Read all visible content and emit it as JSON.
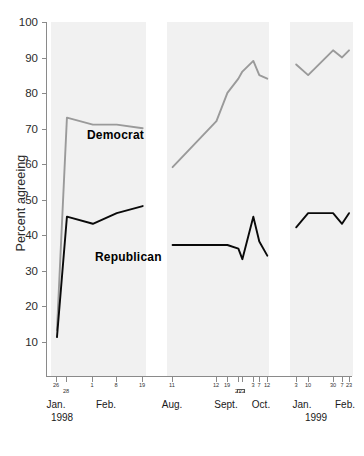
{
  "chart_data": {
    "type": "line",
    "title": "",
    "xlabel": "",
    "ylabel": "Percent agreeing",
    "ylim": [
      10,
      100
    ],
    "ytick_values": [
      100,
      90,
      80,
      70,
      60,
      50,
      40,
      30,
      20,
      10
    ],
    "grid": false,
    "legend": "inline-labels",
    "colors": {
      "democrat": "#9a9a9a",
      "republican": "#0a0a0a",
      "band": "#f1f1f1",
      "axis": "#8a8a8a"
    },
    "panels": [
      {
        "name": "jan-feb-1998",
        "months": [
          "Jan.",
          "Feb."
        ],
        "year": "1998",
        "day_ticks": [
          "26",
          "28",
          "1",
          "8",
          "19"
        ],
        "series": [
          {
            "name": "Democrat",
            "x": [
              "26",
              "28",
              "1",
              "8",
              "19"
            ],
            "values": [
              13,
              73,
              71,
              71,
              70
            ]
          },
          {
            "name": "Republican",
            "x": [
              "26",
              "28",
              "1",
              "8",
              "19"
            ],
            "values": [
              11,
              45,
              43,
              46,
              48
            ]
          }
        ]
      },
      {
        "name": "aug-oct-1998",
        "months": [
          "Aug.",
          "Sept.",
          "Oct."
        ],
        "year": "",
        "day_ticks": [
          "11",
          "12",
          "19",
          "21",
          "22",
          "3",
          "7",
          "12"
        ],
        "series": [
          {
            "name": "Democrat",
            "x": [
              "11",
              "12",
              "19",
              "21",
              "22",
              "3",
              "7",
              "12"
            ],
            "values": [
              59,
              72,
              80,
              84,
              86,
              89,
              85,
              84
            ]
          },
          {
            "name": "Republican",
            "x": [
              "11",
              "12",
              "19",
              "21",
              "22",
              "3",
              "7",
              "12"
            ],
            "values": [
              37,
              37,
              37,
              36,
              33,
              45,
              38,
              34
            ]
          }
        ]
      },
      {
        "name": "jan-feb-1999",
        "months": [
          "Jan.",
          "Feb."
        ],
        "year": "1999",
        "day_ticks": [
          "3",
          "10",
          "30",
          "7",
          "23"
        ],
        "series": [
          {
            "name": "Democrat",
            "x": [
              "3",
              "10",
              "30",
              "7",
              "23"
            ],
            "values": [
              88,
              85,
              92,
              90,
              92
            ]
          },
          {
            "name": "Republican",
            "x": [
              "3",
              "10",
              "30",
              "7",
              "23"
            ],
            "values": [
              42,
              46,
              46,
              43,
              46
            ]
          }
        ]
      }
    ],
    "series_labels": [
      {
        "name": "Democrat",
        "text": "Democrat"
      },
      {
        "name": "Republican",
        "text": "Republican"
      }
    ]
  },
  "axis": {
    "y_title": "Percent agreeing",
    "y_ticks": [
      "100",
      "90",
      "80",
      "70",
      "60",
      "50",
      "40",
      "30",
      "20",
      "10"
    ]
  },
  "labels": {
    "democrat": "Democrat",
    "republican": "Republican"
  },
  "xaxis": {
    "panel1": {
      "days": [
        "26",
        "28",
        "1",
        "8",
        "19"
      ],
      "months": [
        "Jan.",
        "Feb."
      ],
      "year": "1998"
    },
    "panel2": {
      "days": [
        "11",
        "12",
        "19",
        "21",
        "22",
        "3",
        "7",
        "12"
      ],
      "months": [
        "Aug.",
        "Sept.",
        "Oct."
      ],
      "year": ""
    },
    "panel3": {
      "days": [
        "3",
        "10",
        "30",
        "7",
        "23"
      ],
      "months": [
        "Jan.",
        "Feb."
      ],
      "year": "1999"
    }
  }
}
